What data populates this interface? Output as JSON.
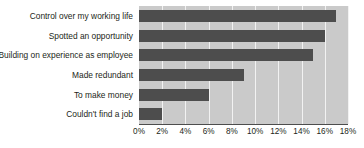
{
  "chart_data": {
    "type": "bar",
    "orientation": "horizontal",
    "title": "",
    "xlabel": "",
    "ylabel": "",
    "categories": [
      "Control over my working life",
      "Spotted an opportunity",
      "Building on experience as employee",
      "Made redundant",
      "To make money",
      "Couldn't find a job"
    ],
    "values": [
      17,
      16,
      15,
      9,
      6,
      2
    ],
    "value_format": "percent",
    "xlim": [
      0,
      18
    ],
    "ticks": [
      0,
      2,
      4,
      6,
      8,
      10,
      12,
      14,
      16,
      18
    ],
    "tick_labels": [
      "0%",
      "2%",
      "4%",
      "6%",
      "8%",
      "10%",
      "12%",
      "14%",
      "16%",
      "18%"
    ],
    "grid": {
      "vertical": true,
      "horizontal": false
    },
    "legend": null,
    "colors": {
      "bar": "#4d4d4d",
      "plot_background": "#cacaca",
      "gridline": "#f2f2f2",
      "axis_line": "#4d4d4d",
      "text": "#231f20",
      "page_background": "#ffffff"
    }
  }
}
